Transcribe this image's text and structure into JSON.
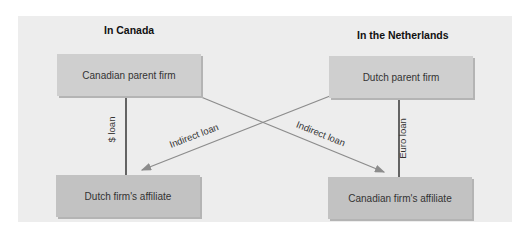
{
  "regions": {
    "left": {
      "title": "In Canada"
    },
    "right": {
      "title": "In the Netherlands"
    }
  },
  "boxes": {
    "canadian_parent": {
      "label": "Canadian parent firm"
    },
    "dutch_parent": {
      "label": "Dutch parent firm"
    },
    "dutch_affiliate": {
      "label": "Dutch firm's affiliate"
    },
    "canadian_affiliate": {
      "label": "Canadian firm's affiliate"
    }
  },
  "connectors": {
    "dollar_loan": {
      "label": "$ loan",
      "from": "Canadian parent firm",
      "to": "Dutch firm's affiliate"
    },
    "euro_loan": {
      "label": "Euro loan",
      "from": "Dutch parent firm",
      "to": "Canadian firm's affiliate"
    },
    "indirect_left": {
      "label": "Indirect loan",
      "from": "Dutch parent firm",
      "to": "Dutch firm's affiliate"
    },
    "indirect_right": {
      "label": "Indirect loan",
      "from": "Canadian parent firm",
      "to": "Canadian firm's affiliate"
    }
  },
  "colors": {
    "panel": "#ededed",
    "parent_box": "#cfcfcf",
    "affiliate_box": "#c2c2c2",
    "direct_line": "#1a1a1a",
    "indirect_line": "#8c8c8c"
  }
}
